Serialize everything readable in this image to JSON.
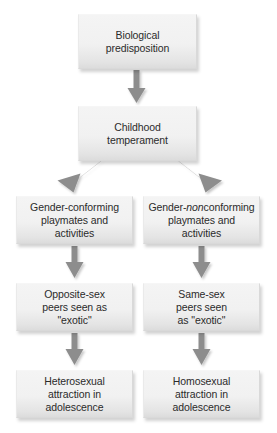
{
  "diagram": {
    "type": "flowchart",
    "title": "",
    "accent_colors": {
      "box_fill_top": "#f4f4f4",
      "box_fill_bottom": "#dcdcdc",
      "box_border": "#d9d9d9",
      "arrow": "#8d8d8d",
      "arrow_shadow": "#bdbdbd",
      "text": "#2b2b2b",
      "background": "#ffffff"
    },
    "nodes": [
      {
        "id": "biological-predisposition",
        "lines": [
          "Biological",
          "predisposition"
        ],
        "text": "Biological predisposition",
        "x": 78,
        "y": 14,
        "w": 119,
        "h": 55,
        "column": "center"
      },
      {
        "id": "childhood-temperament",
        "lines": [
          "Childhood",
          "temperament"
        ],
        "text": "Childhood temperament",
        "x": 78,
        "y": 106,
        "w": 119,
        "h": 55,
        "column": "center"
      },
      {
        "id": "gender-conforming-playmates",
        "lines": [
          "Gender-conforming",
          "playmates and",
          "activities"
        ],
        "text": "Gender-conforming playmates and activities",
        "html": "Gender-conforming<br>playmates and<br>activities",
        "x": 16,
        "y": 196,
        "w": 117,
        "h": 48,
        "column": "left"
      },
      {
        "id": "gender-nonconforming-playmates",
        "lines": [
          "Gender-nonconforming",
          "playmates and",
          "activities"
        ],
        "text": "Gender-nonconforming playmates and activities",
        "html": "Gender-<em>non</em>conforming<br>playmates and<br>activities",
        "x": 143,
        "y": 196,
        "w": 117,
        "h": 48,
        "column": "right"
      },
      {
        "id": "opposite-sex-peers-exotic",
        "lines": [
          "Opposite-sex",
          "peers seen as",
          "\"exotic\""
        ],
        "text": "Opposite-sex peers seen as \"exotic\"",
        "html": "Opposite-sex<br>peers seen as<br>\"exotic\"",
        "x": 16,
        "y": 283,
        "w": 117,
        "h": 48,
        "column": "left"
      },
      {
        "id": "same-sex-peers-exotic",
        "lines": [
          "Same-sex",
          "peers seen",
          "as \"exotic\""
        ],
        "text": "Same-sex peers seen as \"exotic\"",
        "html": "Same-sex<br>peers seen<br>as \"exotic\"",
        "x": 143,
        "y": 283,
        "w": 117,
        "h": 48,
        "column": "right"
      },
      {
        "id": "heterosexual-attraction",
        "lines": [
          "Heterosexual",
          "attraction in",
          "adolescence"
        ],
        "text": "Heterosexual attraction in adolescence",
        "html": "Heterosexual<br>attraction in<br>adolescence",
        "x": 16,
        "y": 370,
        "w": 117,
        "h": 48,
        "column": "left"
      },
      {
        "id": "homosexual-attraction",
        "lines": [
          "Homosexual",
          "attraction in",
          "adolescence"
        ],
        "text": "Homosexual attraction in adolescence",
        "html": "Homosexual<br>attraction in<br>adolescence",
        "x": 143,
        "y": 370,
        "w": 117,
        "h": 48,
        "column": "right"
      }
    ],
    "edges": [
      {
        "id": "edge-predisposition-to-temperament",
        "from": "biological-predisposition",
        "to": "childhood-temperament",
        "kind": "vertical"
      },
      {
        "id": "edge-temperament-to-conforming",
        "from": "childhood-temperament",
        "to": "gender-conforming-playmates",
        "kind": "diagonal-left"
      },
      {
        "id": "edge-temperament-to-nonconforming",
        "from": "childhood-temperament",
        "to": "gender-nonconforming-playmates",
        "kind": "diagonal-right"
      },
      {
        "id": "edge-conforming-to-opposite-sex",
        "from": "gender-conforming-playmates",
        "to": "opposite-sex-peers-exotic",
        "kind": "vertical"
      },
      {
        "id": "edge-nonconforming-to-same-sex",
        "from": "gender-nonconforming-playmates",
        "to": "same-sex-peers-exotic",
        "kind": "vertical"
      },
      {
        "id": "edge-opposite-sex-to-heterosexual",
        "from": "opposite-sex-peers-exotic",
        "to": "heterosexual-attraction",
        "kind": "vertical"
      },
      {
        "id": "edge-same-sex-to-homosexual",
        "from": "same-sex-peers-exotic",
        "to": "homosexual-attraction",
        "kind": "vertical"
      }
    ]
  }
}
